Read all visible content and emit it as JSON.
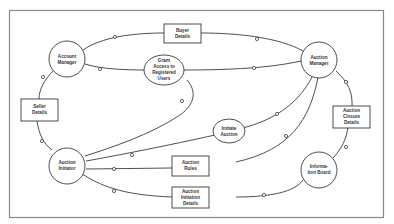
{
  "diagram": {
    "type": "data-flow-diagram",
    "colors": {
      "background": "#ffffff",
      "stroke": "#3a3a3a",
      "frame": "#8a8a8a",
      "text": "#333333"
    },
    "processes": [
      {
        "id": "account_manager",
        "lines": [
          "Account",
          "Manager"
        ]
      },
      {
        "id": "auction_manager",
        "lines": [
          "Auction",
          "Manager"
        ]
      },
      {
        "id": "auction_initiator",
        "lines": [
          "Auction",
          "Initiator"
        ]
      },
      {
        "id": "information_board",
        "lines": [
          "Informa-",
          "tion Board"
        ]
      },
      {
        "id": "grant_access",
        "lines": [
          "Grant",
          "Access to",
          "Registered",
          "Users"
        ]
      },
      {
        "id": "initiate_auction",
        "lines": [
          "Initiate",
          "Auction"
        ]
      }
    ],
    "data_stores": [
      {
        "id": "buyer_details",
        "lines": [
          "Buyer",
          "Details"
        ]
      },
      {
        "id": "seller_details",
        "lines": [
          "Seller",
          "Details"
        ]
      },
      {
        "id": "auction_closure_details",
        "lines": [
          "Auction",
          "Closure",
          "Details"
        ]
      },
      {
        "id": "auction_rules",
        "lines": [
          "Auction",
          "Rules"
        ]
      },
      {
        "id": "auction_initiation_details",
        "lines": [
          "Auction",
          "Initiation",
          "Details"
        ]
      }
    ],
    "connections": [
      [
        "account_manager",
        "buyer_details"
      ],
      [
        "buyer_details",
        "auction_manager"
      ],
      [
        "account_manager",
        "grant_access"
      ],
      [
        "grant_access",
        "auction_manager"
      ],
      [
        "account_manager",
        "seller_details"
      ],
      [
        "seller_details",
        "auction_initiator"
      ],
      [
        "grant_access",
        "auction_initiator"
      ],
      [
        "auction_manager",
        "auction_closure_details"
      ],
      [
        "auction_closure_details",
        "information_board"
      ],
      [
        "auction_manager",
        "initiate_auction"
      ],
      [
        "initiate_auction",
        "auction_initiator"
      ],
      [
        "auction_manager",
        "auction_rules"
      ],
      [
        "auction_rules",
        "auction_initiator"
      ],
      [
        "auction_initiator",
        "auction_initiation_details"
      ],
      [
        "auction_initiation_details",
        "information_board"
      ]
    ]
  }
}
